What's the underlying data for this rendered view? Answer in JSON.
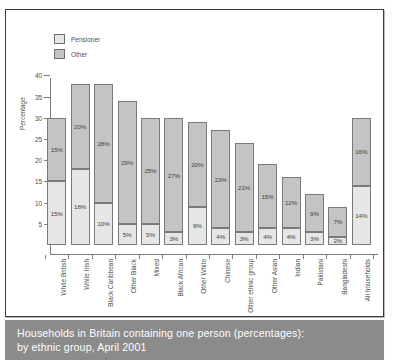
{
  "caption": {
    "line1": "Households in Britain containing one person (percentages):",
    "line2": "by ethnic group, April 2001"
  },
  "legend": {
    "items": [
      {
        "label": "Pensioner",
        "color": "#e6e6e6",
        "swatch_icon": "legend-swatch-pensioner"
      },
      {
        "label": "Other",
        "color": "#c4c4c4",
        "swatch_icon": "legend-swatch-other"
      }
    ]
  },
  "axes": {
    "ylabel": "Percentage",
    "yticks": [
      "5",
      "10",
      "15",
      "20",
      "25",
      "30",
      "35",
      "40"
    ],
    "ymin": 0,
    "ymax": 41.5
  },
  "chart_data": {
    "type": "bar",
    "subtype": "stacked-vertical",
    "title": "Households in Britain containing one person (percentages): by ethnic group, April 2001",
    "xlabel": "",
    "ylabel": "Percentage",
    "ylim": [
      0,
      41.5
    ],
    "yticks": [
      5,
      10,
      15,
      20,
      25,
      30,
      35,
      40
    ],
    "grid": false,
    "legend_position": "top-left",
    "categories": [
      "White British",
      "White Irish",
      "Black Caribbean",
      "Other Black",
      "Mixed",
      "Black African",
      "Other White",
      "Chinese",
      "Other ethnic group",
      "Other Asian",
      "Indian",
      "Pakistani",
      "Bangladeshi",
      "All households"
    ],
    "series": [
      {
        "name": "Pensioner",
        "color": "#e6e6e6",
        "values": [
          15,
          18,
          10,
          5,
          5,
          3,
          9,
          4,
          3,
          4,
          4,
          3,
          2,
          14
        ],
        "labels": [
          "15%",
          "18%",
          "10%",
          "5%",
          "5%",
          "3%",
          "9%",
          "4%",
          "3%",
          "4%",
          "4%",
          "3%",
          "2%",
          "14%"
        ]
      },
      {
        "name": "Other",
        "color": "#c4c4c4",
        "values": [
          15,
          20,
          28,
          29,
          25,
          27,
          20,
          23,
          21,
          15,
          12,
          9,
          7,
          16
        ],
        "labels": [
          "15%",
          "20%",
          "28%",
          "29%",
          "25%",
          "27%",
          "20%",
          "23%",
          "21%",
          "15%",
          "12%",
          "9%",
          "7%",
          "16%"
        ]
      }
    ],
    "totals": [
      30,
      38,
      38,
      34,
      30,
      30,
      29,
      27,
      24,
      19,
      16,
      12,
      9,
      30
    ]
  }
}
